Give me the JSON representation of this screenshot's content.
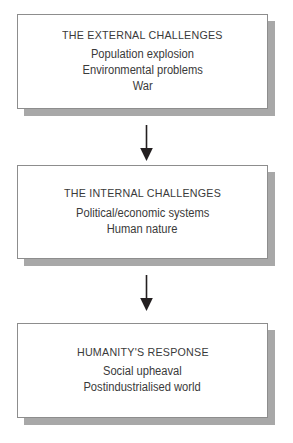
{
  "diagram": {
    "type": "flowchart",
    "orientation": "vertical",
    "background_color": "#ffffff",
    "text_color": "#3a3a3a",
    "box_border_color": "#8d8d8d",
    "box_fill_color": "#ffffff",
    "shadow_color": "#a8a8a8",
    "arrow_color": "#231f20",
    "nodes": [
      {
        "id": "external-challenges",
        "title": "THE EXTERNAL CHALLENGES",
        "lines": [
          "Population explosion",
          "Environmental problems",
          "War"
        ]
      },
      {
        "id": "internal-challenges",
        "title": "THE INTERNAL CHALLENGES",
        "lines": [
          "Political/economic systems",
          "Human nature"
        ]
      },
      {
        "id": "humanitys-response",
        "title": "HUMANITY'S RESPONSE",
        "lines": [
          "Social upheaval",
          "Postindustrialised world"
        ]
      }
    ],
    "connectors": [
      {
        "id": "connector-1",
        "from": "external-challenges",
        "to": "internal-challenges",
        "direction": "down"
      },
      {
        "id": "connector-2",
        "from": "internal-challenges",
        "to": "humanitys-response",
        "direction": "down"
      }
    ]
  }
}
